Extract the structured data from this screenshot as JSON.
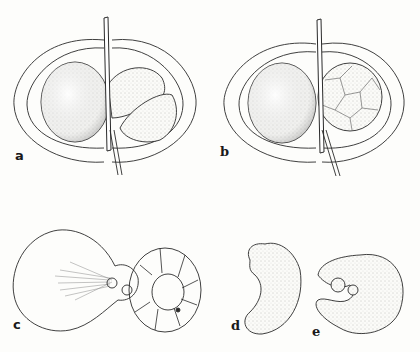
{
  "figure": {
    "panels": [
      {
        "id": "a",
        "label": "a",
        "description": "two-cell stage: large stippled cell and lobed cell within membrane, stalk through middle"
      },
      {
        "id": "b",
        "label": "b",
        "description": "large stippled cell with multicellular cluster on right within membrane"
      },
      {
        "id": "c",
        "label": "c",
        "description": "outline drawing: large cell with radiating fibers and ring of cells"
      },
      {
        "id": "d",
        "label": "d",
        "description": "curved kidney-shaped stippled body"
      },
      {
        "id": "e",
        "label": "e",
        "description": "coiled stippled body with segmented outer rim"
      }
    ],
    "colors": {
      "ink": "#2a2a2a",
      "paper": "#fdfdfb",
      "stipple": "#9a9a9a"
    }
  }
}
